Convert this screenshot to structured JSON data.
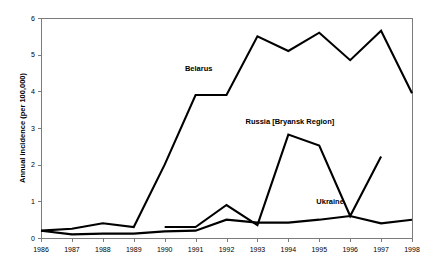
{
  "chart_data": {
    "type": "line",
    "title": "",
    "xlabel": "",
    "ylabel": "Annual incidence (per 100,000)",
    "x": [
      1986,
      1987,
      1988,
      1989,
      1990,
      1991,
      1992,
      1993,
      1994,
      1995,
      1996,
      1997,
      1998
    ],
    "categories": [
      "1986",
      "1987",
      "1988",
      "1989",
      "1990",
      "1991",
      "1992",
      "1993",
      "1994",
      "1995",
      "1996",
      "1997",
      "1998"
    ],
    "xlim": [
      1986,
      1998
    ],
    "ylim": [
      0,
      6
    ],
    "yticks": [
      "0",
      "1",
      "2",
      "3",
      "4",
      "5",
      "6"
    ],
    "ytick_values": [
      0,
      1,
      2,
      3,
      4,
      5,
      6
    ],
    "grid": false,
    "legend": "inline-annotations",
    "legend_position": "inline",
    "series": [
      {
        "name": "Belarus",
        "label_x": 1991.1,
        "label_y": 4.55,
        "x": [
          1986,
          1987,
          1988,
          1989,
          1990,
          1991,
          1992,
          1993,
          1994,
          1995,
          1996,
          1997,
          1998
        ],
        "values": [
          0.2,
          0.25,
          0.4,
          0.3,
          2.0,
          3.9,
          3.9,
          5.5,
          5.1,
          5.6,
          4.85,
          5.65,
          3.95
        ]
      },
      {
        "name": "Russia [Bryansk Region]",
        "label_x": 1994.05,
        "label_y": 3.1,
        "x": [
          1990,
          1991,
          1992,
          1993,
          1994,
          1995,
          1996,
          1997
        ],
        "values": [
          0.3,
          0.3,
          0.9,
          0.35,
          2.82,
          2.52,
          0.6,
          2.22
        ]
      },
      {
        "name": "Ukraine",
        "label_x": 1995.35,
        "label_y": 0.93,
        "x": [
          1986,
          1987,
          1988,
          1989,
          1990,
          1991,
          1992,
          1993,
          1994,
          1995,
          1996,
          1997,
          1998
        ],
        "values": [
          0.2,
          0.1,
          0.12,
          0.12,
          0.18,
          0.2,
          0.5,
          0.42,
          0.42,
          0.5,
          0.6,
          0.4,
          0.5
        ]
      }
    ],
    "colors": {
      "series_stroke": "#000000",
      "axis": "#7b7b7b",
      "background": "#ffffff",
      "text": "#000000"
    }
  }
}
